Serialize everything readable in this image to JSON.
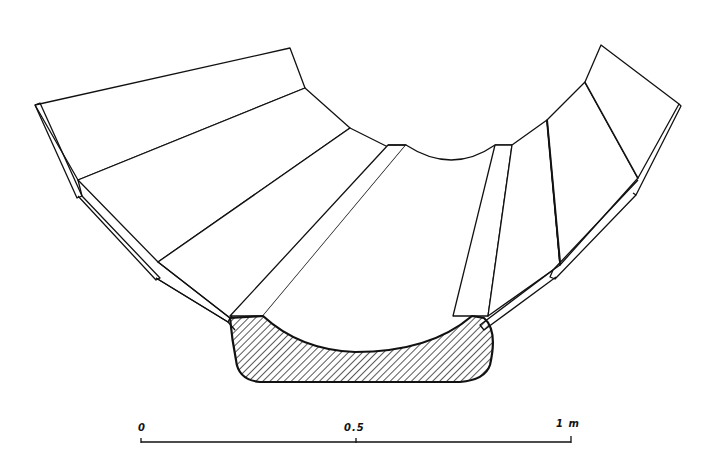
{
  "figure": {
    "stroke_color": "#111111",
    "background_color": "#ffffff",
    "hatch": "diagonal hatched keel section"
  },
  "scale_bar": {
    "labels": [
      "0",
      "0.5",
      "1 m"
    ],
    "start_label": "0",
    "mid_label": "0.5",
    "end_label": "1 m"
  }
}
